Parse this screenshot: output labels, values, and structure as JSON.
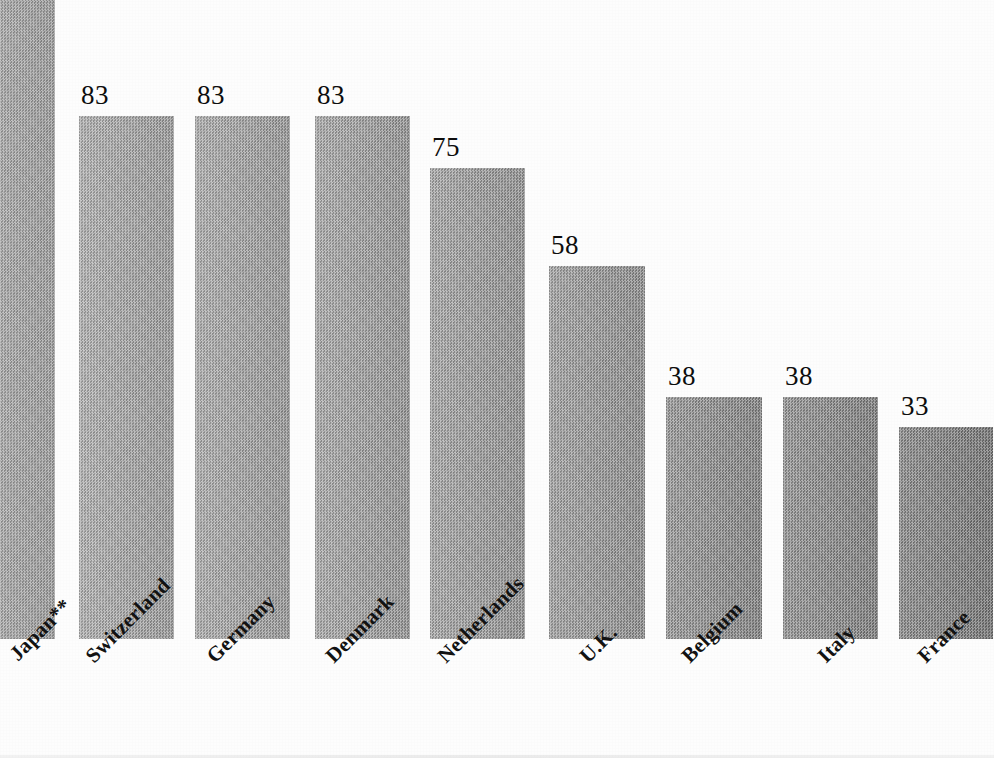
{
  "chart_data": {
    "type": "bar",
    "title": "",
    "subtitle": "",
    "xlabel": "",
    "ylabel": "",
    "grid": false,
    "legend": null,
    "ylim": [
      0,
      100
    ],
    "categories": [
      "Japan**",
      "Switzerland",
      "Germany",
      "Denmark",
      "Netherlands",
      "U.K.",
      "Belgium",
      "Italy",
      "France"
    ],
    "values": [
      100,
      83,
      83,
      83,
      75,
      58,
      38,
      38,
      33
    ],
    "value_labels": [
      "",
      "83",
      "83",
      "83",
      "75",
      "58",
      "38",
      "38",
      "33"
    ],
    "bars": [
      {
        "category": "Japan**",
        "value": 100,
        "label": "",
        "label_visible": false,
        "x": -40,
        "width": 95,
        "top": -20,
        "tone": "#a9a9a9",
        "cropped": true
      },
      {
        "category": "Switzerland",
        "value": 83,
        "label": "83",
        "label_visible": true,
        "x": 79,
        "width": 95,
        "top": 116,
        "tone": "#a7a7a7",
        "cropped": false
      },
      {
        "category": "Germany",
        "value": 83,
        "label": "83",
        "label_visible": true,
        "x": 195,
        "width": 95,
        "top": 116,
        "tone": "#a4a4a4",
        "cropped": false
      },
      {
        "category": "Denmark",
        "value": 83,
        "label": "83",
        "label_visible": true,
        "x": 315,
        "width": 95,
        "top": 116,
        "tone": "#a0a0a0",
        "cropped": false
      },
      {
        "category": "Netherlands",
        "value": 75,
        "label": "75",
        "label_visible": true,
        "x": 430,
        "width": 95,
        "top": 168,
        "tone": "#9c9c9c",
        "cropped": false
      },
      {
        "category": "U.K.",
        "value": 58,
        "label": "58",
        "label_visible": true,
        "x": 549,
        "width": 96,
        "top": 266,
        "tone": "#979797",
        "cropped": false
      },
      {
        "category": "Belgium",
        "value": 38,
        "label": "38",
        "label_visible": true,
        "x": 666,
        "width": 96,
        "top": 397,
        "tone": "#8c8c8c",
        "cropped": false
      },
      {
        "category": "Italy",
        "value": 38,
        "label": "38",
        "label_visible": true,
        "x": 783,
        "width": 95,
        "top": 397,
        "tone": "#868686",
        "cropped": false
      },
      {
        "category": "France",
        "value": 33,
        "label": "33",
        "label_visible": true,
        "x": 899,
        "width": 94,
        "top": 427,
        "tone": "#7b7b7b",
        "cropped": false
      }
    ],
    "baseline_y": 639,
    "label_positions": [
      {
        "text": "Japan**",
        "x": 6,
        "y": 10
      },
      {
        "text": "Switzerland",
        "x": 82,
        "y": 12
      },
      {
        "text": "Germany",
        "x": 203,
        "y": 12
      },
      {
        "text": "Denmark",
        "x": 322,
        "y": 12
      },
      {
        "text": "Netherlands",
        "x": 434,
        "y": 12
      },
      {
        "text": "U.K.",
        "x": 576,
        "y": 12
      },
      {
        "text": "Belgium",
        "x": 678,
        "y": 12
      },
      {
        "text": "Italy",
        "x": 814,
        "y": 12
      },
      {
        "text": "France",
        "x": 914,
        "y": 12
      }
    ],
    "colors": {
      "background": "#fdfdfd",
      "bar_light": "#a9a9a9",
      "bar_dark": "#7b7b7b",
      "text": "#101010"
    }
  }
}
